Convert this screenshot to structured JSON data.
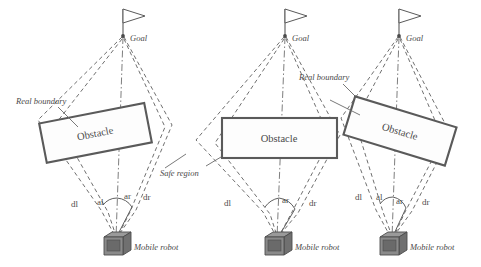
{
  "figure": {
    "type": "diagram",
    "title": "",
    "background_color": "#ffffff",
    "line_color": "#6f6f6f",
    "obstacle_stroke_color": "#5a5a5a",
    "robot_color": "#8a8a8a"
  },
  "common_labels": {
    "goal": "Goal",
    "obstacle": "Obstacle",
    "mobile_robot": "Mobile robot",
    "real_boundary": "Real boundary",
    "safe_region": "Safe region",
    "dist_left": "dl",
    "dist_right": "dr",
    "angle_left": "al",
    "angle_right": "ar"
  },
  "panels": [
    {
      "id": "panel-left",
      "goal_label": "Goal",
      "obstacle_label": "Obstacle",
      "obstacle_rotation_deg": -11,
      "robot_label": "Mobile robot",
      "annotations": [
        "Real boundary"
      ],
      "measure_labels": [
        "dl",
        "al",
        "ar",
        "dr"
      ]
    },
    {
      "id": "panel-middle",
      "goal_label": "Goal",
      "obstacle_label": "Obstacle",
      "obstacle_rotation_deg": 0,
      "robot_label": "Mobile robot",
      "annotations": [
        "Safe region",
        "Real boundary"
      ],
      "measure_labels": [
        "dl",
        "ar",
        "dr"
      ]
    },
    {
      "id": "panel-right",
      "goal_label": "Goal",
      "obstacle_label": "Obstacle",
      "obstacle_rotation_deg": 17,
      "robot_label": "Mobile robot",
      "annotations": [
        "Real boundary"
      ],
      "measure_labels": [
        "dl",
        "al",
        "ar",
        "dr"
      ]
    }
  ]
}
